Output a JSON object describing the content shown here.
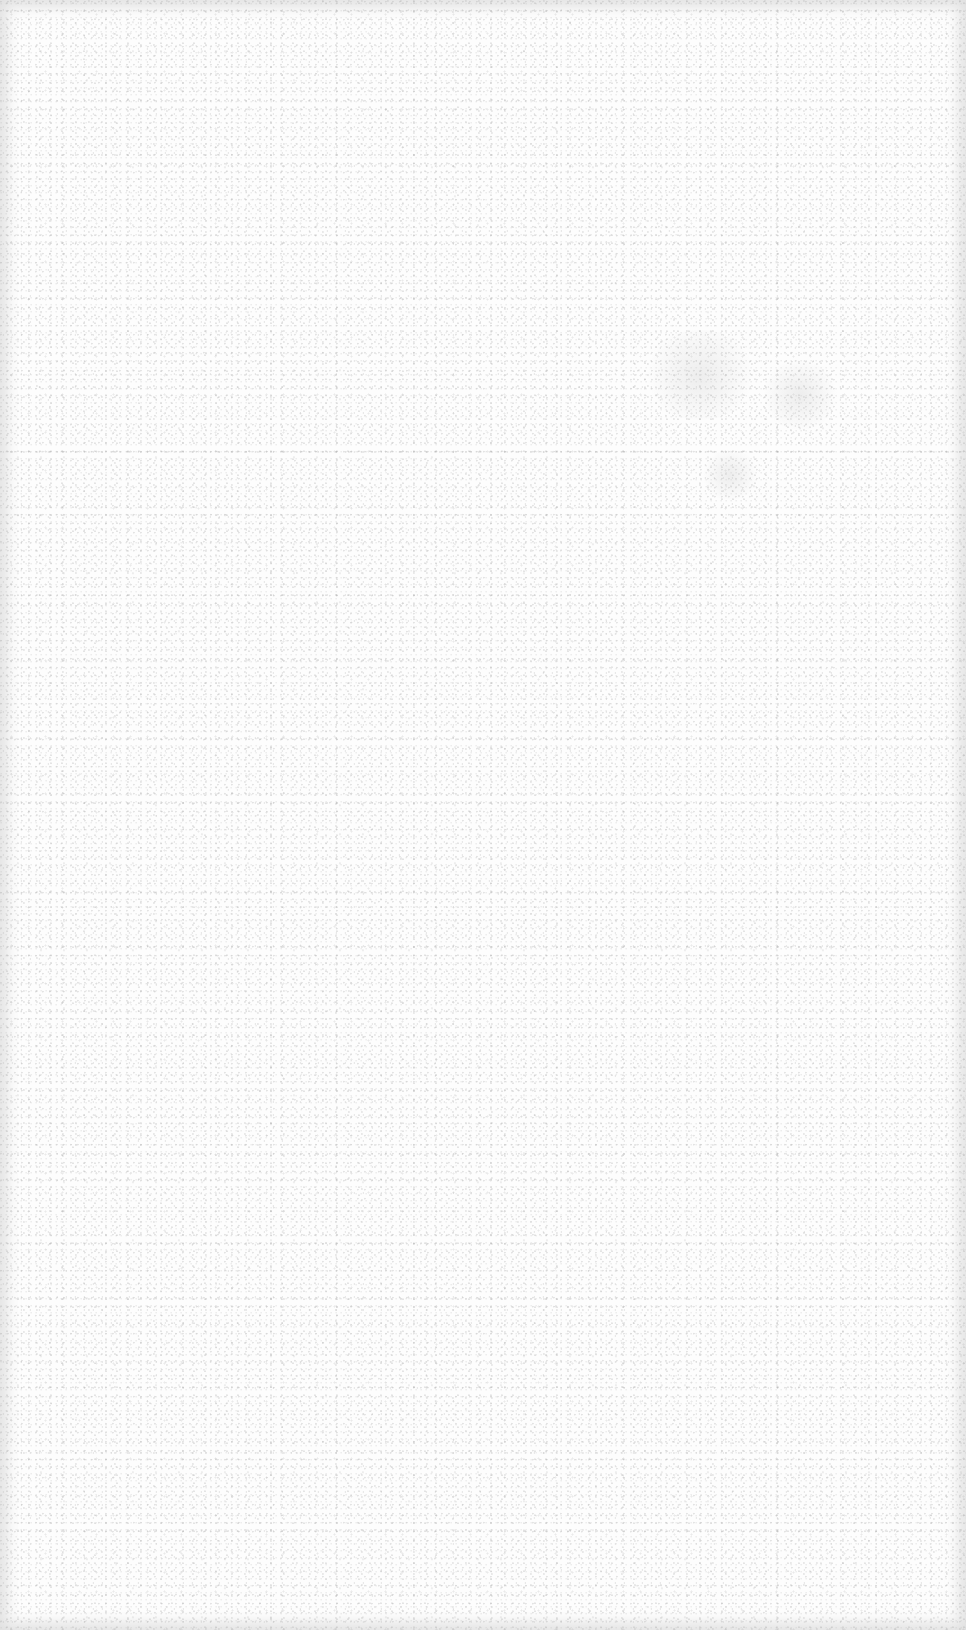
{
  "page": {
    "type": "blank-scanned-page",
    "text_content": "",
    "colors": {
      "paper": "#fdfdfd",
      "edge_shadow": "#e0e0e0",
      "speckle": "#aaaaaa"
    }
  }
}
